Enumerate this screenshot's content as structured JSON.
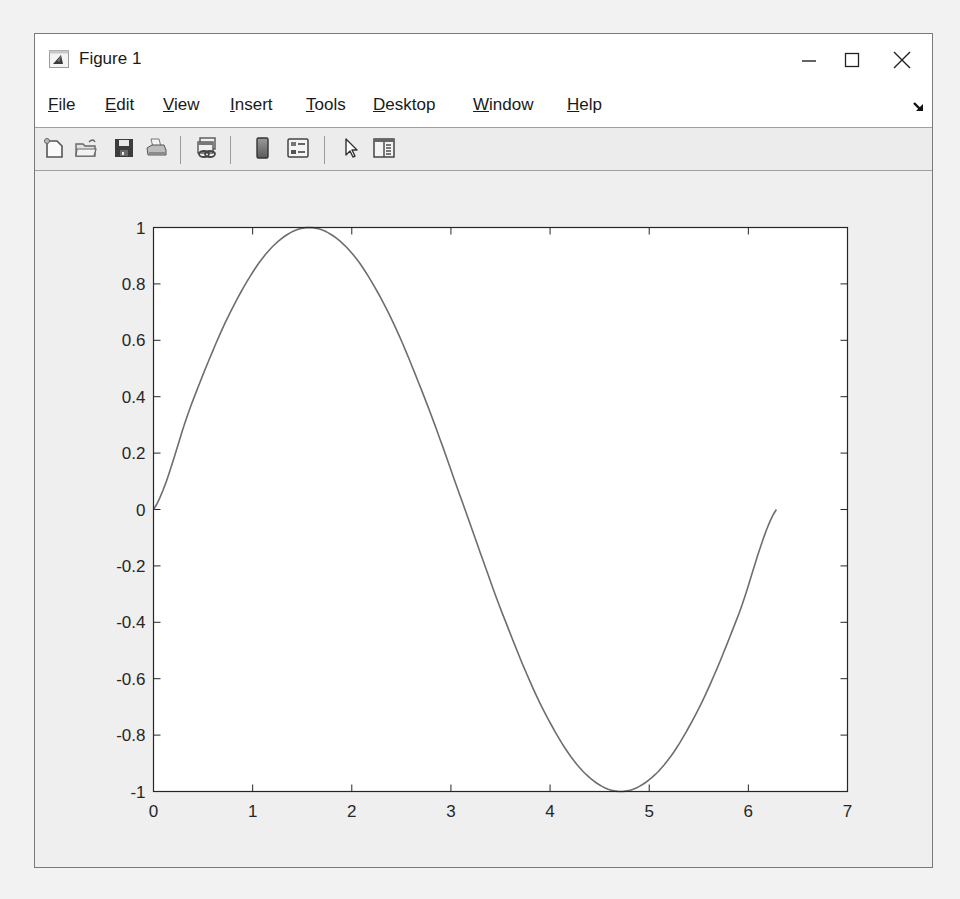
{
  "window": {
    "title": "Figure 1",
    "controls": {
      "minimize": "minimize",
      "maximize": "maximize",
      "close": "close"
    }
  },
  "menubar": {
    "items": [
      {
        "label": "File",
        "mnemonic": "F"
      },
      {
        "label": "Edit",
        "mnemonic": "E"
      },
      {
        "label": "View",
        "mnemonic": "V"
      },
      {
        "label": "Insert",
        "mnemonic": "I"
      },
      {
        "label": "Tools",
        "mnemonic": "T"
      },
      {
        "label": "Desktop",
        "mnemonic": "D"
      },
      {
        "label": "Window",
        "mnemonic": "W"
      },
      {
        "label": "Help",
        "mnemonic": "H"
      }
    ],
    "dock_icon": "dock-arrow-icon"
  },
  "toolbar": {
    "buttons": [
      {
        "name": "new-figure",
        "icon": "new-file-icon"
      },
      {
        "name": "open-file",
        "icon": "folder-open-icon"
      },
      {
        "name": "save-figure",
        "icon": "floppy-disk-icon"
      },
      {
        "name": "print-figure",
        "icon": "printer-icon"
      },
      {
        "name": "link-plot",
        "icon": "link-plot-icon"
      },
      {
        "name": "insert-colorbar",
        "icon": "colorbar-icon"
      },
      {
        "name": "insert-legend",
        "icon": "legend-icon"
      },
      {
        "name": "edit-plot",
        "icon": "pointer-arrow-icon"
      },
      {
        "name": "open-property-inspector",
        "icon": "property-inspector-icon"
      }
    ]
  },
  "chart_data": {
    "type": "line",
    "title": "",
    "xlabel": "",
    "ylabel": "",
    "xlim": [
      0,
      7
    ],
    "ylim": [
      -1,
      1
    ],
    "grid": false,
    "legend": null,
    "x_ticks": [
      "0",
      "1",
      "2",
      "3",
      "4",
      "5",
      "6",
      "7"
    ],
    "y_ticks": [
      "1",
      "0.8",
      "0.6",
      "0.4",
      "0.2",
      "0",
      "-0.2",
      "-0.4",
      "-0.6",
      "-0.8",
      "-1"
    ],
    "series": [
      {
        "name": "sin(x)",
        "color": "#6e6e6e",
        "x": [
          0,
          0.3927,
          0.7854,
          1.1781,
          1.5708,
          1.9635,
          2.3562,
          2.7489,
          3.1416,
          3.5343,
          3.927,
          4.3197,
          4.7124,
          5.1051,
          5.4978,
          5.8905,
          6.2832
        ],
        "y": [
          0,
          0.3827,
          0.7071,
          0.9239,
          1,
          0.9239,
          0.7071,
          0.3827,
          0,
          -0.3827,
          -0.7071,
          -0.9239,
          -1,
          -0.9239,
          -0.7071,
          -0.3827,
          0
        ]
      }
    ]
  }
}
